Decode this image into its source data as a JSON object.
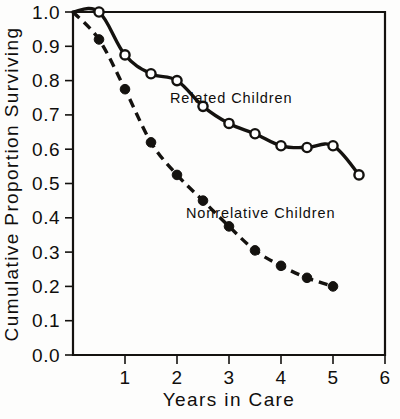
{
  "chart_data": {
    "type": "line",
    "title": "",
    "xlabel": "Years in Care",
    "ylabel": "Cumulative Proportion Surviving",
    "xlim": [
      0,
      6
    ],
    "ylim": [
      0.0,
      1.0
    ],
    "grid": false,
    "legend_position": "inline-annotations",
    "xticks": [
      "1",
      "2",
      "3",
      "4",
      "5",
      "6"
    ],
    "xtick_values": [
      1,
      2,
      3,
      4,
      5,
      6
    ],
    "yticks": [
      "0.0",
      "0.1",
      "0.2",
      "0.3",
      "0.4",
      "0.5",
      "0.6",
      "0.7",
      "0.8",
      "0.9",
      "1.0"
    ],
    "ytick_values": [
      0.0,
      0.1,
      0.2,
      0.3,
      0.4,
      0.5,
      0.6,
      0.7,
      0.8,
      0.9,
      1.0
    ],
    "series": [
      {
        "name": "Related Children",
        "marker": "open-circle",
        "line_style": "solid",
        "annotation": "Related Children",
        "x": [
          0.0,
          0.5,
          1.0,
          1.5,
          2.0,
          2.5,
          3.0,
          3.5,
          4.0,
          4.5,
          5.0
        ],
        "values": [
          1.0,
          1.0,
          0.875,
          0.82,
          0.8,
          0.725,
          0.675,
          0.645,
          0.61,
          0.605,
          0.61
        ]
      },
      {
        "name": "Nonrelative Children",
        "marker": "filled-circle",
        "line_style": "dashed",
        "annotation": "Nonrelative Children",
        "x": [
          0.0,
          0.5,
          1.0,
          1.5,
          2.0,
          2.5,
          3.0,
          3.5,
          4.0,
          4.5,
          5.0
        ],
        "values": [
          1.0,
          0.92,
          0.775,
          0.62,
          0.525,
          0.45,
          0.375,
          0.305,
          0.26,
          0.225,
          0.2
        ]
      }
    ],
    "series_extra": {
      "related_tail_x": 5.5,
      "related_tail_y": 0.525,
      "nonrelative_note": "dashed curve declining monotonically"
    }
  },
  "annotations": {
    "related": "Related Children",
    "nonrelative": "Nonrelative Children"
  },
  "colors": {
    "ink": "#14120f",
    "background": "#fdfdfc",
    "marker_fill": "#ffffff"
  }
}
